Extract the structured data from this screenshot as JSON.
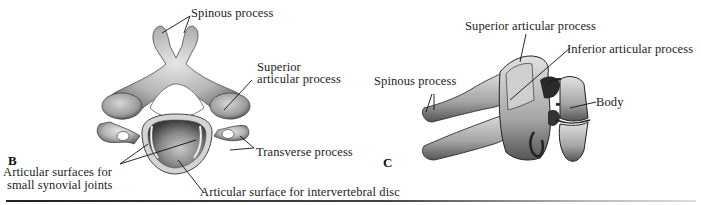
{
  "figure": {
    "panels": [
      {
        "id": "B",
        "letter": "B",
        "view": "superior",
        "labels": {
          "spinous_process": "Spinous process",
          "superior_articular_line1": "Superior",
          "superior_articular_line2": "articular process",
          "transverse_process": "Transverse process",
          "articular_surfaces_line1": "Articular surfaces for",
          "articular_surfaces_line2": "small synovial joints",
          "articular_surface_disc": "Articular surface for intervertebral disc"
        }
      },
      {
        "id": "C",
        "letter": "C",
        "view": "lateral",
        "labels": {
          "superior_articular_process": "Superior articular process",
          "inferior_articular_process": "Inferior articular process",
          "spinous_process": "Spinous process",
          "body": "Body"
        }
      }
    ],
    "colors": {
      "bone_light": "#d8d8d8",
      "bone_mid": "#9a9a9a",
      "bone_dark": "#3a3a3a",
      "leader_line": "#111111",
      "text": "#1c1c1c"
    }
  }
}
